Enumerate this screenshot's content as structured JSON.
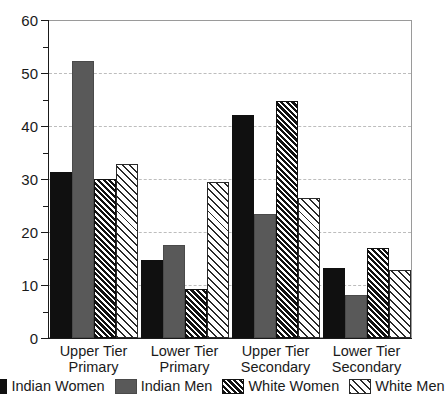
{
  "chart_data": {
    "type": "bar",
    "title": "",
    "subtitle": "",
    "xlabel": "",
    "ylabel": "",
    "ylim": [
      0,
      60
    ],
    "ytick_step": 10,
    "yminor_step": 5,
    "ytick_labels": [
      "0",
      "10",
      "20",
      "30",
      "40",
      "50",
      "60"
    ],
    "grid": true,
    "grid_axis": "y",
    "legend_position": "bottom",
    "categories": [
      "Upper Tier Primary",
      "Lower Tier Primary",
      "Upper Tier Secondary",
      "Lower Tier Secondary"
    ],
    "category_lines": [
      [
        "Upper Tier",
        "Primary"
      ],
      [
        "Lower Tier",
        "Primary"
      ],
      [
        "Upper Tier",
        "Secondary"
      ],
      [
        "Lower Tier",
        "Secondary"
      ]
    ],
    "series": [
      {
        "name": "Indian Women",
        "fill": "solid-black",
        "color": "#101010",
        "values": [
          31.3,
          14.7,
          42.0,
          13.3
        ]
      },
      {
        "name": "Indian Men",
        "fill": "solid-gray",
        "color": "#595959",
        "values": [
          52.2,
          17.5,
          23.4,
          8.2
        ]
      },
      {
        "name": "White Women",
        "fill": "dense-diagonal-hatch",
        "color": "#111111",
        "values": [
          30.0,
          9.3,
          44.8,
          17.0
        ]
      },
      {
        "name": "White Men",
        "fill": "sparse-diagonal-hatch",
        "color": "#2a2a2a",
        "values": [
          32.8,
          29.5,
          26.4,
          12.9
        ]
      }
    ]
  },
  "style": {
    "background": "#ffffff",
    "axis_color": "#1a1a1a",
    "frame_color": "#9a9a9a",
    "grid_color": "#bdbdbd"
  }
}
